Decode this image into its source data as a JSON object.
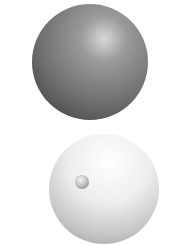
{
  "diagram": {
    "type": "atomic-model-comparison",
    "panels": [
      {
        "id": "plum-pudding-model",
        "description": "Uniform sphere with embedded charges; all particle rays pass straight through",
        "sphere": {
          "cx": 90,
          "cy": 62,
          "r": 58,
          "fill": "#7a7a7a"
        },
        "particles": [
          {
            "x": 71,
            "y": 27
          },
          {
            "x": 100,
            "y": 30
          },
          {
            "x": 58,
            "y": 48
          },
          {
            "x": 90,
            "y": 52
          },
          {
            "x": 117,
            "y": 57
          },
          {
            "x": 46,
            "y": 69
          },
          {
            "x": 75,
            "y": 74
          },
          {
            "x": 110,
            "y": 85
          },
          {
            "x": 60,
            "y": 91
          },
          {
            "x": 90,
            "y": 101
          }
        ],
        "rays": [
          {
            "y": 42,
            "x1": 13,
            "x2": 155
          },
          {
            "y": 55,
            "x1": 13,
            "x2": 155
          },
          {
            "y": 69,
            "x1": 13,
            "x2": 155
          },
          {
            "y": 82,
            "x1": 13,
            "x2": 155
          }
        ]
      },
      {
        "id": "nuclear-model",
        "description": "Mostly empty sphere with small dense nucleus; most rays pass, one reflects back, one deflects",
        "sphere": {
          "cx": 104,
          "cy": 66,
          "r": 55,
          "fill": "#e6e6e6"
        },
        "nucleus": {
          "cx": 82,
          "cy": 59,
          "r": 7
        },
        "rays": [
          {
            "kind": "straight",
            "y": 26,
            "x1": 13,
            "x2": 155
          },
          {
            "kind": "straight",
            "y": 41,
            "x1": 13,
            "x2": 155
          },
          {
            "kind": "straight",
            "y": 74,
            "x1": 13,
            "x2": 155
          },
          {
            "kind": "straight",
            "y": 94,
            "x1": 13,
            "x2": 155
          },
          {
            "kind": "reflected",
            "x1": 75,
            "y1": 60,
            "x2": 11,
            "y2": 49
          },
          {
            "kind": "incoming",
            "y": 59,
            "x1": 13,
            "x2": 75
          },
          {
            "kind": "incoming",
            "y": 65,
            "x1": 13,
            "x2": 80
          },
          {
            "kind": "deflected",
            "x1": 80,
            "y1": 65,
            "x2": 155,
            "y2": 86
          }
        ]
      }
    ],
    "colors": {
      "ray": "#2a2a2a",
      "background": "#ffffff"
    }
  }
}
